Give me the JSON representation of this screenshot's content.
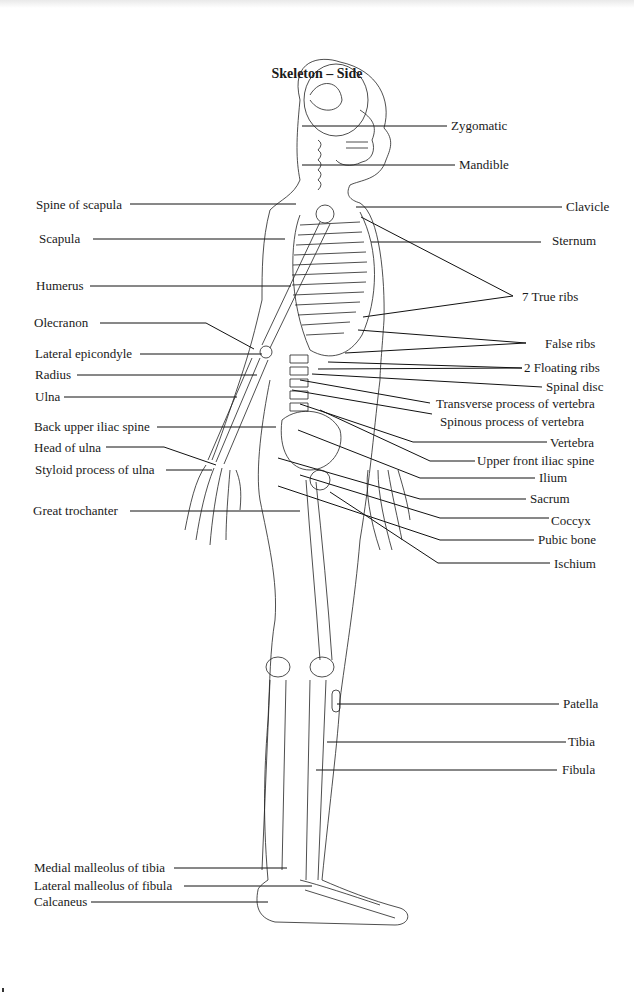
{
  "title": "Skeleton – Side",
  "labels": {
    "left": [
      {
        "id": "spine-of-scapula",
        "text": "Spine of scapula",
        "x": 36,
        "y": 198
      },
      {
        "id": "scapula",
        "text": "Scapula",
        "x": 39,
        "y": 232
      },
      {
        "id": "humerus",
        "text": "Humerus",
        "x": 36,
        "y": 279
      },
      {
        "id": "olecranon",
        "text": "Olecranon",
        "x": 34,
        "y": 316
      },
      {
        "id": "lateral-epicondyle",
        "text": "Lateral epicondyle",
        "x": 35,
        "y": 347
      },
      {
        "id": "radius",
        "text": "Radius",
        "x": 35,
        "y": 366
      },
      {
        "id": "ulna",
        "text": "Ulna",
        "x": 35,
        "y": 389
      },
      {
        "id": "back-upper-iliac-spine",
        "text": "Back upper iliac spine",
        "x": 34,
        "y": 419
      },
      {
        "id": "head-of-ulna",
        "text": "Head of ulna",
        "x": 34,
        "y": 441
      },
      {
        "id": "styloid-process-of-ulna",
        "text": "Styloid process of ulna",
        "x": 35,
        "y": 463
      },
      {
        "id": "great-trochanter",
        "text": "Great trochanter",
        "x": 33,
        "y": 503
      },
      {
        "id": "medial-malleolus-of-tibia",
        "text": "Medial malleolus of tibia",
        "x": 34,
        "y": 861
      },
      {
        "id": "lateral-malleolus-of-fibula",
        "text": "Lateral malleolus of fibula",
        "x": 34,
        "y": 878
      },
      {
        "id": "calcaneus",
        "text": "Calcaneus",
        "x": 34,
        "y": 895
      }
    ],
    "right": [
      {
        "id": "zygomatic",
        "text": "Zygomatic",
        "x": 451,
        "y": 119
      },
      {
        "id": "mandible",
        "text": "Mandible",
        "x": 459,
        "y": 158
      },
      {
        "id": "clavicle",
        "text": "Clavicle",
        "x": 566,
        "y": 201
      },
      {
        "id": "sternum",
        "text": "Sternum",
        "x": 552,
        "y": 233
      },
      {
        "id": "7-true-ribs",
        "text": "7 True ribs",
        "x": 522,
        "y": 289
      },
      {
        "id": "false-ribs",
        "text": "False ribs",
        "x": 545,
        "y": 336
      },
      {
        "id": "2-floating-ribs",
        "text": "2 Floating ribs",
        "x": 524,
        "y": 360
      },
      {
        "id": "spinal-disc",
        "text": "Spinal disc",
        "x": 546,
        "y": 380
      },
      {
        "id": "transverse-process-of-vertebra",
        "text": "Transverse process of vertebra",
        "x": 436,
        "y": 397
      },
      {
        "id": "spinous-process-of-vertebra",
        "text": "Spinous process of vertebra",
        "x": 440,
        "y": 415
      },
      {
        "id": "vertebra",
        "text": "Vertebra",
        "x": 550,
        "y": 436
      },
      {
        "id": "upper-front-iliac-spine",
        "text": "Upper front iliac spine",
        "x": 477,
        "y": 454
      },
      {
        "id": "ilium",
        "text": "Ilium",
        "x": 539,
        "y": 471
      },
      {
        "id": "sacrum",
        "text": "Sacrum",
        "x": 530,
        "y": 492
      },
      {
        "id": "coccyx",
        "text": "Coccyx",
        "x": 551,
        "y": 514
      },
      {
        "id": "pubic-bone",
        "text": "Pubic bone",
        "x": 538,
        "y": 533
      },
      {
        "id": "ischium",
        "text": "Ischium",
        "x": 554,
        "y": 557
      },
      {
        "id": "patella",
        "text": "Patella",
        "x": 563,
        "y": 697
      },
      {
        "id": "tibia",
        "text": "Tibia",
        "x": 568,
        "y": 735
      },
      {
        "id": "fibula",
        "text": "Fibula",
        "x": 562,
        "y": 763
      }
    ]
  }
}
